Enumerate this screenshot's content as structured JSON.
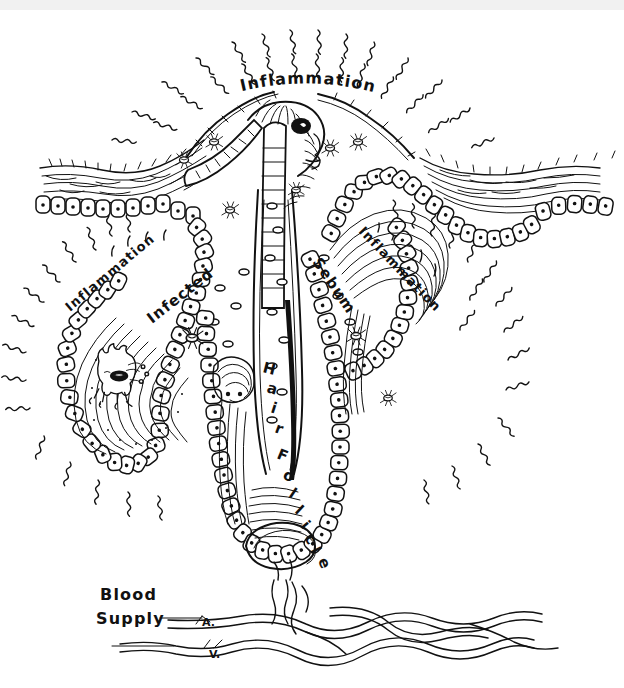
{
  "figure": {
    "medium": "pen-and-ink line drawing",
    "background_color": "#ffffff",
    "ink_color": "#111111",
    "top_band_color": "#f1f1f1"
  },
  "labels": {
    "inflammation_top": "Inflammation",
    "inflammation_left": "Inflammation",
    "inflammation_right": "Inflammation",
    "infected": "Infected",
    "sebum": "Sebum",
    "hair_follicle": "Hair Follicle",
    "blood_supply_line1": "Blood",
    "blood_supply_line2": "Supply",
    "artery_marker": "A.",
    "vein_marker": "V."
  },
  "hair_follicle_letters": [
    "H",
    "a",
    "i",
    "r",
    "F",
    "o",
    "l",
    "l",
    "i",
    "c",
    "l",
    "e"
  ],
  "structures": [
    {
      "name": "epidermis-stratum-corneum",
      "description": "wavy horizontal hatch layer across skin surface"
    },
    {
      "name": "basal-cell-layer",
      "description": "row of outlined cells with nuclei dots"
    },
    {
      "name": "hair-shaft",
      "description": "banded hair emerging from follicle opening"
    },
    {
      "name": "follicle-canal",
      "description": "central vertical canal down to bulb"
    },
    {
      "name": "sebaceous-gland-left",
      "description": "lobed gland containing bacteria creature"
    },
    {
      "name": "sebaceous-gland-right",
      "description": "lobed gland filled with sebum"
    },
    {
      "name": "hair-bulb",
      "description": "rounded base with dermal papilla"
    },
    {
      "name": "blood-vessels",
      "description": "intertwined artery and vein supplying the papilla"
    },
    {
      "name": "inflammation-rays",
      "description": "radiating squiggle heat lines"
    },
    {
      "name": "bacteria",
      "description": "small mite/bacteria glyphs scattered in dermis"
    },
    {
      "name": "sebum-droplets",
      "description": "small oval droplets in the canal"
    }
  ]
}
